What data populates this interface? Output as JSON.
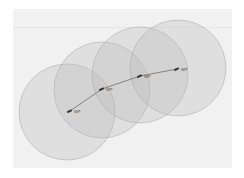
{
  "map": {
    "background": "#f1f1f1",
    "circle_fill": "#bdbdbd",
    "circle_stroke": "#b0b0b0",
    "path_color": "#6f6f6f",
    "marker_color": "#3a3a3a",
    "waypoints": [
      {
        "label": "WP",
        "x": 70,
        "y": 111,
        "radius": 48,
        "cx": 67,
        "cy": 112
      },
      {
        "label": "WP",
        "x": 102,
        "y": 89,
        "radius": 48,
        "cx": 102,
        "cy": 90
      },
      {
        "label": "WP",
        "x": 140,
        "y": 76,
        "radius": 48,
        "cx": 140,
        "cy": 75
      },
      {
        "label": "WP",
        "x": 177,
        "y": 69,
        "radius": 48,
        "cx": 178,
        "cy": 68
      }
    ]
  }
}
